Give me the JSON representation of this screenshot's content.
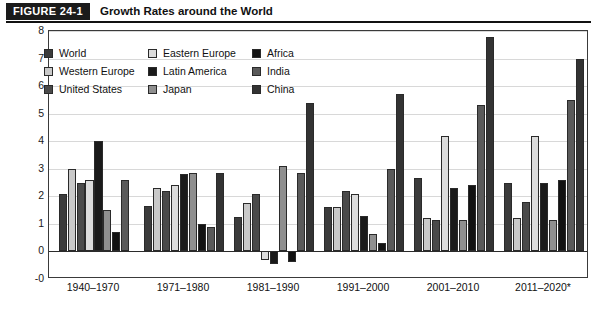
{
  "header": {
    "figure_tag": "FIGURE 24-1",
    "title": "Growth Rates around the World"
  },
  "legend": {
    "items": [
      {
        "label": "World",
        "color": "#3b3b3b"
      },
      {
        "label": "Western Europe",
        "color": "#c9c9c9"
      },
      {
        "label": "United States",
        "color": "#4a4a4a"
      },
      {
        "label": "Eastern Europe",
        "color": "#dcdcdc"
      },
      {
        "label": "Latin America",
        "color": "#1a1a1a"
      },
      {
        "label": "Japan",
        "color": "#8f8f8f"
      },
      {
        "label": "Africa",
        "color": "#121212"
      },
      {
        "label": "India",
        "color": "#5a5a5a"
      },
      {
        "label": "China",
        "color": "#333333"
      }
    ]
  },
  "axes": {
    "y_ticks": [
      "8",
      "7",
      "6",
      "5",
      "4",
      "3",
      "2",
      "1",
      "0",
      "-0"
    ],
    "y_min": -1,
    "y_max": 8,
    "x_labels": [
      "1940–1970",
      "1971–1980",
      "1981–1990",
      "1991–2000",
      "2001–2010",
      "2011–2020*"
    ]
  },
  "source": {
    "note": ""
  },
  "chart_data": {
    "type": "bar",
    "title": "Growth Rates around the World",
    "xlabel": "",
    "ylabel": "",
    "ylim": [
      -1,
      8
    ],
    "grid": true,
    "legend_position": "top-left-inside",
    "categories": [
      "1940–1970",
      "1971–1980",
      "1981–1990",
      "1991–2000",
      "2001–2010",
      "2011–2020*"
    ],
    "series": [
      {
        "name": "World",
        "color": "#3b3b3b",
        "values": [
          2.1,
          1.65,
          1.25,
          1.6,
          2.65,
          2.5
        ]
      },
      {
        "name": "Western Europe",
        "color": "#c9c9c9",
        "values": [
          3.0,
          2.3,
          1.75,
          1.6,
          1.2,
          1.2
        ]
      },
      {
        "name": "United States",
        "color": "#4a4a4a",
        "values": [
          2.5,
          2.2,
          2.1,
          2.2,
          1.15,
          1.8
        ]
      },
      {
        "name": "Eastern Europe",
        "color": "#dcdcdc",
        "values": [
          2.6,
          2.4,
          -0.3,
          2.1,
          4.2,
          4.2
        ]
      },
      {
        "name": "Latin America",
        "color": "#1a1a1a",
        "values": [
          4.0,
          2.8,
          -0.45,
          1.3,
          2.3,
          2.5
        ]
      },
      {
        "name": "Japan",
        "color": "#8f8f8f",
        "values": [
          1.5,
          2.85,
          3.1,
          0.65,
          1.15,
          1.15
        ]
      },
      {
        "name": "Africa",
        "color": "#121212",
        "values": [
          0.7,
          1.0,
          -0.4,
          0.3,
          2.4,
          2.6
        ]
      },
      {
        "name": "India",
        "color": "#5a5a5a",
        "values": [
          2.6,
          0.9,
          2.85,
          3.0,
          5.3,
          5.5
        ]
      },
      {
        "name": "China",
        "color": "#333333",
        "values": [
          null,
          2.85,
          5.4,
          5.7,
          7.8,
          7.0
        ]
      }
    ]
  }
}
